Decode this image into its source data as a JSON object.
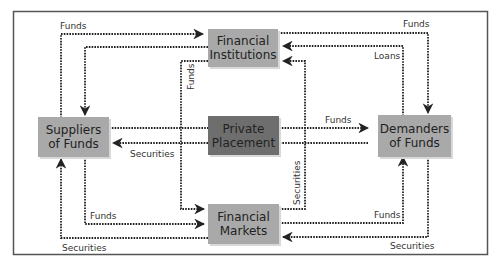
{
  "diagram": {
    "colors": {
      "frame": "#555555",
      "box_light": "#a9a9a9",
      "box_dark": "#6e6e6e",
      "arrow": "#222222"
    },
    "nodes": {
      "financial_institutions": {
        "line1": "Financial",
        "line2": "Institutions"
      },
      "private_placement": {
        "line1": "Private",
        "line2": "Placement"
      },
      "financial_markets": {
        "line1": "Financial",
        "line2": "Markets"
      },
      "suppliers": {
        "line1": "Suppliers",
        "line2": "of Funds"
      },
      "demanders": {
        "line1": "Demanders",
        "line2": "of Funds"
      }
    },
    "edges": {
      "sup_to_fi_funds": "Funds",
      "fi_to_sup_deposits": "Deposits/Shares",
      "fi_to_dem_funds": "Funds",
      "dem_to_fi_loans": "Loans",
      "fi_to_fm_funds": "Funds",
      "fm_to_fi_securities": "Securities",
      "pp_to_dem_funds": "Funds",
      "pp_to_sup_securities": "Securities",
      "sup_to_fm_funds": "Funds",
      "fm_to_sup_securities": "Securities",
      "fm_to_dem_funds": "Funds",
      "dem_to_fm_securities": "Securities"
    }
  }
}
